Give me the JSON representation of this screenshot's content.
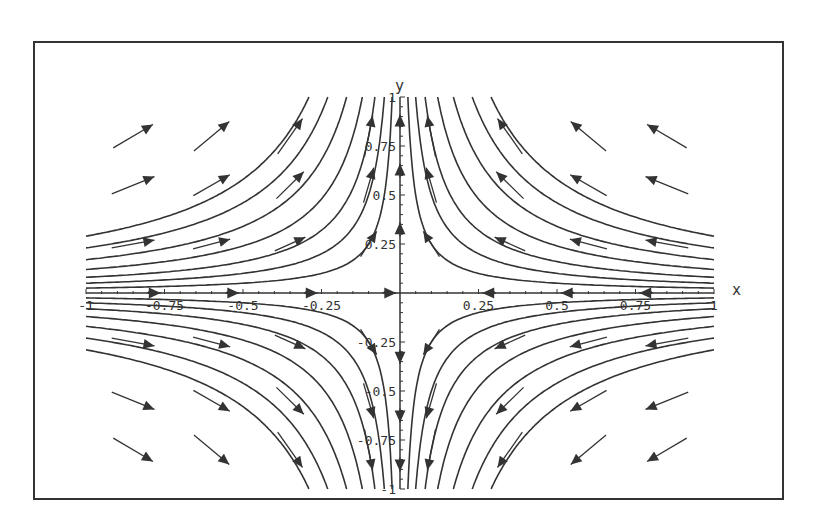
{
  "chart_data": {
    "type": "vector_field_phase_portrait",
    "title": "",
    "xlabel": "x",
    "ylabel": "y",
    "xlim": [
      -1,
      1
    ],
    "ylim": [
      -1,
      1
    ],
    "grid": false,
    "legend": null,
    "system": {
      "dx_dt": "-x",
      "dy_dt": "y",
      "trajectories": "x*y = c (hyperbolas), saddle at origin"
    },
    "x_ticks": [
      {
        "value": -1,
        "label": "-1"
      },
      {
        "value": -0.75,
        "label": "-0.75"
      },
      {
        "value": -0.5,
        "label": "-0.5"
      },
      {
        "value": -0.25,
        "label": "-0.25"
      },
      {
        "value": 0.25,
        "label": "0.25"
      },
      {
        "value": 0.5,
        "label": "0.5"
      },
      {
        "value": 0.75,
        "label": "0.75"
      },
      {
        "value": 1,
        "label": "1"
      }
    ],
    "y_ticks": [
      {
        "value": 1,
        "label": "1"
      },
      {
        "value": 0.75,
        "label": "0.75"
      },
      {
        "value": 0.5,
        "label": "0.5"
      },
      {
        "value": 0.25,
        "label": "0.25"
      },
      {
        "value": -0.25,
        "label": "-0.25"
      },
      {
        "value": -0.5,
        "label": "-0.5"
      },
      {
        "value": -0.75,
        "label": "-0.75"
      },
      {
        "value": -1,
        "label": "-1"
      }
    ],
    "trajectory_constants": [
      0.025,
      0.05,
      0.08,
      0.12,
      0.17,
      0.23,
      0.29
    ],
    "vector_grid": {
      "x": [
        -0.85,
        -0.6,
        -0.35,
        -0.1,
        0.1,
        0.35,
        0.6,
        0.85
      ],
      "y": [
        0.8,
        0.55,
        0.25,
        -0.25,
        -0.55,
        -0.8
      ]
    },
    "x_axis_arrows_x": [
      -0.8,
      -0.55,
      -0.3,
      -0.05,
      0.3,
      0.55,
      0.8,
      0.9
    ],
    "y_axis_arrows_y": [
      0.85,
      0.6,
      0.3,
      -0.3,
      -0.6,
      -0.85
    ]
  },
  "colors": {
    "ink": "#333333",
    "background": "#ffffff",
    "frame": "#333333"
  }
}
